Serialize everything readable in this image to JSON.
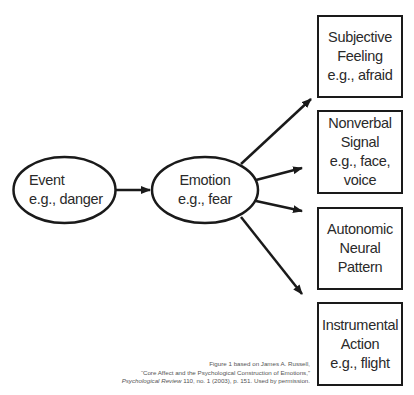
{
  "diagram": {
    "source_node": {
      "id": "event",
      "lines": [
        "Event",
        "e.g., danger"
      ]
    },
    "center_node": {
      "id": "emotion",
      "lines": [
        "Emotion",
        "e.g., fear"
      ]
    },
    "outputs": [
      {
        "id": "subjective-feeling",
        "lines": [
          "Subjective",
          "Feeling",
          "e.g., afraid"
        ]
      },
      {
        "id": "nonverbal-signal",
        "lines": [
          "Nonverbal",
          "Signal",
          "e.g., face,",
          "voice"
        ]
      },
      {
        "id": "autonomic-neural-pattern",
        "lines": [
          "Autonomic",
          "Neural",
          "Pattern"
        ]
      },
      {
        "id": "instrumental-action",
        "lines": [
          "Instrumental",
          "Action",
          "e.g., flight"
        ]
      }
    ],
    "edges": [
      {
        "from": "event",
        "to": "emotion"
      },
      {
        "from": "emotion",
        "to": "subjective-feeling"
      },
      {
        "from": "emotion",
        "to": "nonverbal-signal"
      },
      {
        "from": "emotion",
        "to": "autonomic-neural-pattern"
      },
      {
        "from": "emotion",
        "to": "instrumental-action"
      }
    ]
  },
  "caption": {
    "line1": "Figure 1 based on James A. Russell,",
    "line2": "“Core Affect and the Psychological Construction of Emotions,”",
    "line3_italic": "Psychological Review",
    "line3_rest": " 110, no. 1 (2003), p. 151. Used by permission."
  },
  "colors": {
    "stroke": "#1a1a1a",
    "text": "#2a2a2a",
    "background": "#ffffff"
  }
}
